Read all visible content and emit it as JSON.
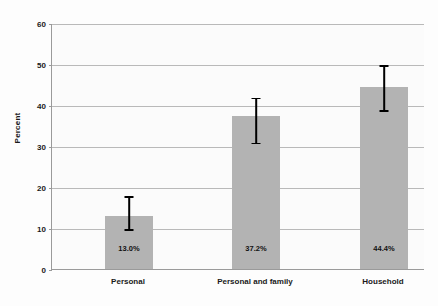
{
  "chart_data": {
    "type": "bar",
    "title": "",
    "xlabel": "",
    "ylabel": "Percent",
    "categories": [
      "Personal",
      "Personal and family",
      "Household"
    ],
    "values": [
      13.0,
      37.2,
      44.4
    ],
    "value_labels": [
      "13.0%",
      "37.2%",
      "44.4%"
    ],
    "series": [
      {
        "name": "Percent",
        "values": [
          13.0,
          37.2,
          44.4
        ]
      }
    ],
    "error_bars": [
      {
        "category": "Personal",
        "lower": 10.0,
        "upper": 18.0
      },
      {
        "category": "Personal and family",
        "lower": 31.0,
        "upper": 42.0
      },
      {
        "category": "Household",
        "lower": 39.0,
        "upper": 50.0
      }
    ],
    "ylim": [
      0,
      60
    ],
    "yticks": [
      0,
      10,
      20,
      30,
      40,
      50,
      60
    ],
    "ytick_labels": [
      "0",
      "10",
      "20",
      "30",
      "40",
      "50",
      "60"
    ],
    "grid": true,
    "legend": "none",
    "colors": {
      "bar_fill": "#b3b3b3",
      "error_bar": "#000000",
      "gridline": "#b9b9b9",
      "axis": "#9a9a9a",
      "text": "#1a1a1a",
      "plot_background": "#fbfbfb"
    }
  }
}
